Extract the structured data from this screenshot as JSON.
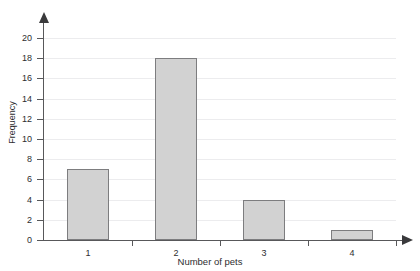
{
  "chart_data": {
    "type": "bar",
    "title": "",
    "xlabel": "Number of pets",
    "ylabel": "Frequency",
    "categories": [
      "1",
      "2",
      "3",
      "4"
    ],
    "values": [
      7,
      18,
      4,
      1
    ],
    "ylim": [
      0,
      20
    ],
    "ytick_step": 2,
    "yticks": [
      "0",
      "2",
      "4",
      "6",
      "8",
      "10",
      "12",
      "14",
      "16",
      "18",
      "20"
    ],
    "grid": true,
    "grid_axis": "y",
    "legend": "none",
    "bar_fill": "#d2d2d2",
    "bar_border": "#7d7d7f",
    "axis_color": "#58585a",
    "grid_color": "#ececee",
    "text_color": "#2d2d2f"
  }
}
